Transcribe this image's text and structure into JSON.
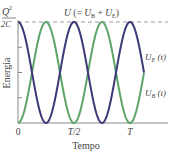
{
  "chart_data": {
    "type": "line",
    "title": "",
    "xlabel": "Tempo",
    "ylabel": "Energia",
    "x_ticks": [
      "0",
      "T/2",
      "T"
    ],
    "y_max_label": {
      "numerator": "Q",
      "superscript": "2",
      "denominator": "2C"
    },
    "total_energy_label": "U (= U_B + U_E)",
    "total_energy_label_display": {
      "U": "U",
      "open": " (= ",
      "UB": "U",
      "UB_sub": "B",
      "plus": " + ",
      "UE": "U",
      "UE_sub": "E",
      "close": ")"
    },
    "series": [
      {
        "name": "U_E(t)",
        "label": "U",
        "label_sub": "E",
        "label_arg": " (t)",
        "color": "#3b3a78",
        "function": "(Q^2/2C) cos^2(2πt/T)",
        "x": [
          0,
          0.125,
          0.25,
          0.375,
          0.5,
          0.625,
          0.75,
          0.875,
          1.0,
          1.125
        ],
        "values": [
          1,
          0.5,
          0,
          0.5,
          1,
          0.5,
          0,
          0.5,
          1,
          0.5
        ]
      },
      {
        "name": "U_B(t)",
        "label": "U",
        "label_sub": "B",
        "label_arg": " (t)",
        "color": "#5da46a",
        "function": "(Q^2/2C) sin^2(2πt/T)",
        "x": [
          0,
          0.125,
          0.25,
          0.375,
          0.5,
          0.625,
          0.75,
          0.875,
          1.0,
          1.125
        ],
        "values": [
          0,
          0.5,
          1,
          0.5,
          0,
          0.5,
          1,
          0.5,
          0,
          0.5
        ]
      },
      {
        "name": "U",
        "color": "#9a9a9a",
        "style": "dashed",
        "x": [
          0,
          1.3
        ],
        "values": [
          1,
          1
        ]
      }
    ],
    "x_range_in_T": [
      0,
      1.3
    ],
    "ylim": [
      0,
      1
    ],
    "y_minor_ticks": [
      0.25,
      0.5,
      0.75
    ],
    "grid": false,
    "legend": "inline labels at right"
  }
}
